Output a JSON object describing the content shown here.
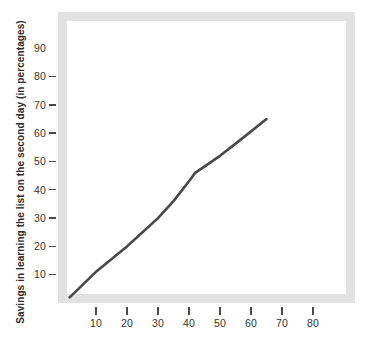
{
  "chart_data": {
    "type": "line",
    "title": "",
    "xlabel": "",
    "ylabel": "Savings in learning the list on the second day (in percentages)",
    "xlim": [
      0,
      90
    ],
    "ylim": [
      0,
      93
    ],
    "grid": false,
    "legend": false,
    "line_color": "#484848",
    "frame_color": "#e2e2e2",
    "background_color": "#ffffff",
    "x_ticks": [
      10,
      20,
      30,
      40,
      50,
      60,
      70,
      80
    ],
    "x_tick_labels": [
      "10",
      "20",
      "30",
      "40",
      "50",
      "60",
      "70",
      "80"
    ],
    "y_ticks": [
      10,
      20,
      30,
      40,
      50,
      60,
      70,
      80,
      90
    ],
    "y_tick_labels": [
      "10",
      "20",
      "30",
      "40",
      "50",
      "60",
      "70",
      "80",
      "90"
    ],
    "series": [
      {
        "name": "savings",
        "x": [
          1.5,
          10,
          20,
          25,
          30,
          35,
          40,
          42,
          50,
          57,
          65
        ],
        "values": [
          2,
          11,
          20,
          25,
          30,
          36,
          43,
          46,
          52,
          58,
          65
        ]
      }
    ]
  }
}
